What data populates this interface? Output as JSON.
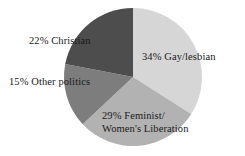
{
  "chart_data": {
    "type": "pie",
    "title": "",
    "subtitle": "",
    "xlabel": "",
    "ylabel": "",
    "grid": false,
    "legend_position": "none",
    "categories": [
      "Gay/lesbian",
      "Feminist/Women's Liberation",
      "Other politics",
      "Christian"
    ],
    "values": [
      34,
      29,
      15,
      22
    ],
    "units": "percent",
    "start_angle_deg": 0,
    "direction": "clockwise",
    "slices": [
      {
        "label": "Gay/lesbian",
        "value": 34,
        "display": "34% Gay/lesbian",
        "color": "#d6d6d6",
        "start_deg": 0,
        "end_deg": 122.4
      },
      {
        "label": "Feminist/Women's Liberation",
        "value": 29,
        "display_line1": "29% Feminist/",
        "display_line2": "Women's Liberation",
        "color": "#b2b2b2",
        "start_deg": 122.4,
        "end_deg": 226.8
      },
      {
        "label": "Other politics",
        "value": 15,
        "display": "15% Other politics",
        "color": "#7d7d7d",
        "start_deg": 226.8,
        "end_deg": 280.8
      },
      {
        "label": "Christian",
        "value": 22,
        "display": "22% Christian",
        "color": "#4d4d4d",
        "start_deg": 280.8,
        "end_deg": 360
      }
    ]
  },
  "labels": {
    "gay_lesbian": "34% Gay/lesbian",
    "feminist_line1": "29% Feminist/",
    "feminist_line2": "Women's Liberation",
    "other_politics": "15% Other politics",
    "christian": "22% Christian"
  },
  "colors": {
    "background": "#ffffff",
    "text": "#1a1a1a",
    "slice_gay_lesbian": "#d6d6d6",
    "slice_feminist": "#b2b2b2",
    "slice_other_politics": "#7d7d7d",
    "slice_christian": "#4d4d4d"
  }
}
